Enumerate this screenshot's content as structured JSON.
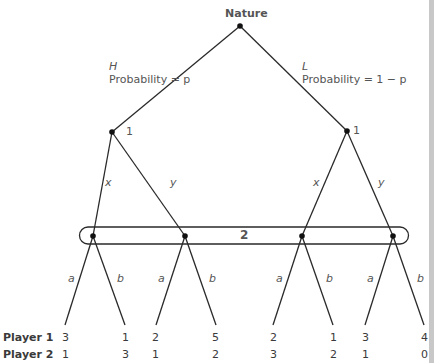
{
  "root": {
    "label": "Nature"
  },
  "branches": {
    "left": {
      "move": "H",
      "prob": "Probability = p"
    },
    "right": {
      "move": "L",
      "prob": "Probability = 1 − p"
    }
  },
  "player1_nodes": {
    "left": "1",
    "right": "1"
  },
  "player1_moves": {
    "x": "x",
    "y": "y"
  },
  "info_set": {
    "label": "2"
  },
  "player2_moves": {
    "a": "a",
    "b": "b"
  },
  "payoff_rows": {
    "p1": "Player 1",
    "p2": "Player 2"
  },
  "payoffs": {
    "p1": [
      "3",
      "1",
      "2",
      "5",
      "2",
      "1",
      "3",
      "4"
    ],
    "p2": [
      "1",
      "3",
      "1",
      "2",
      "3",
      "2",
      "1",
      "0"
    ]
  }
}
